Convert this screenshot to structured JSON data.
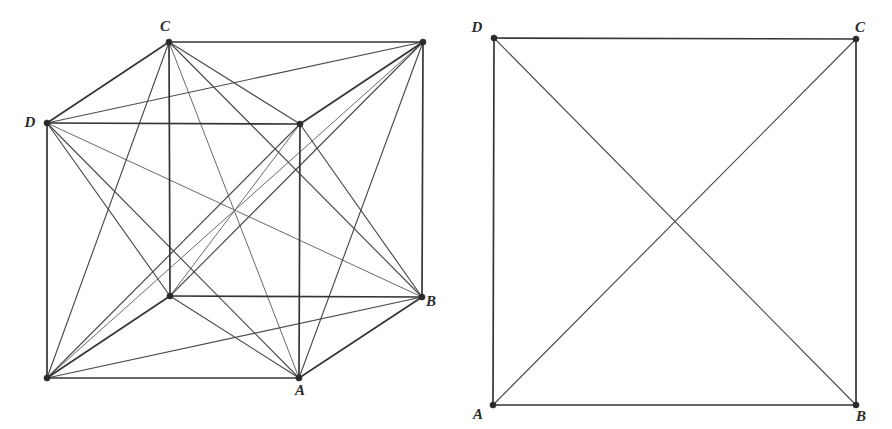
{
  "figure": {
    "background_color": "#ffffff",
    "line_color": "#4a4a4a",
    "strong_line_color": "#353535",
    "light_line_color": "#6a6a6a",
    "label_color": "#2b2b2b",
    "vertex_color": "#2a2a2a",
    "panels": [
      {
        "id": "left-panel",
        "name": "cube-complete-graph",
        "description": "Cube drawn in oblique projection with all 28 segments joining its 8 vertices",
        "vertices": [
          {
            "id": "v0",
            "label": "D",
            "x": 47,
            "y": 123,
            "label_dx": -17,
            "label_dy": 4,
            "labeled": true
          },
          {
            "id": "v1",
            "label": "",
            "x": 300,
            "y": 124,
            "label_dx": 0,
            "label_dy": 0,
            "labeled": false
          },
          {
            "id": "v2",
            "label": "A",
            "x": 299,
            "y": 378,
            "label_dx": 1,
            "label_dy": 17,
            "labeled": true
          },
          {
            "id": "v3",
            "label": "",
            "x": 47,
            "y": 378,
            "label_dx": 0,
            "label_dy": 0,
            "labeled": false
          },
          {
            "id": "v4",
            "label": "C",
            "x": 169,
            "y": 42,
            "label_dx": -4,
            "label_dy": -11,
            "labeled": true
          },
          {
            "id": "v5",
            "label": "",
            "x": 423,
            "y": 42,
            "label_dx": 0,
            "label_dy": 0,
            "labeled": false
          },
          {
            "id": "v6",
            "label": "B",
            "x": 422,
            "y": 297,
            "label_dx": 9,
            "label_dy": 9,
            "labeled": true
          },
          {
            "id": "v7",
            "label": "",
            "x": 170,
            "y": 296,
            "label_dx": 0,
            "label_dy": 0,
            "labeled": false
          }
        ],
        "cube_edges": [
          [
            0,
            1
          ],
          [
            1,
            2
          ],
          [
            2,
            3
          ],
          [
            3,
            0
          ],
          [
            4,
            5
          ],
          [
            5,
            6
          ],
          [
            6,
            7
          ],
          [
            7,
            4
          ],
          [
            0,
            4
          ],
          [
            1,
            5
          ],
          [
            2,
            6
          ],
          [
            3,
            7
          ]
        ],
        "face_diagonals": [
          [
            0,
            2
          ],
          [
            1,
            3
          ],
          [
            4,
            6
          ],
          [
            5,
            7
          ],
          [
            0,
            5
          ],
          [
            1,
            4
          ],
          [
            1,
            6
          ],
          [
            2,
            5
          ],
          [
            2,
            7
          ],
          [
            3,
            6
          ],
          [
            3,
            4
          ],
          [
            0,
            7
          ]
        ],
        "space_diagonals": [
          [
            0,
            6
          ],
          [
            1,
            7
          ],
          [
            2,
            4
          ],
          [
            3,
            5
          ]
        ],
        "edge_count": 28,
        "vertex_count": 8
      },
      {
        "id": "right-panel",
        "name": "square-complete-graph",
        "description": "Square with both diagonals drawn, forming the complete graph on four vertices",
        "vertices": [
          {
            "id": "w0",
            "label": "A",
            "x": 493,
            "y": 405,
            "label_dx": -15,
            "label_dy": 14,
            "labeled": true
          },
          {
            "id": "w1",
            "label": "B",
            "x": 856,
            "y": 405,
            "label_dx": 5,
            "label_dy": 16,
            "labeled": true
          },
          {
            "id": "w2",
            "label": "C",
            "x": 856,
            "y": 39,
            "label_dx": 4,
            "label_dy": -7,
            "labeled": true
          },
          {
            "id": "w3",
            "label": "D",
            "x": 494,
            "y": 38,
            "label_dx": -17,
            "label_dy": -6,
            "labeled": true
          }
        ],
        "square_edges": [
          [
            0,
            1
          ],
          [
            1,
            2
          ],
          [
            2,
            3
          ],
          [
            3,
            0
          ]
        ],
        "face_diagonals": [
          [
            0,
            2
          ],
          [
            1,
            3
          ]
        ],
        "space_diagonals": [],
        "edge_count": 6,
        "vertex_count": 4
      }
    ]
  }
}
